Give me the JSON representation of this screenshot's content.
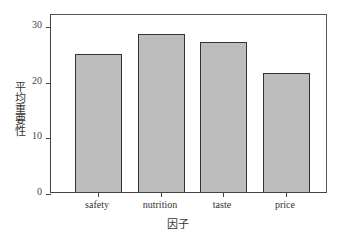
{
  "chart_data": {
    "type": "bar",
    "title": "",
    "xlabel": "因子",
    "ylabel": "平均重要性",
    "categories": [
      "safety",
      "nutrition",
      "taste",
      "price"
    ],
    "values": [
      24.8,
      28.4,
      26.9,
      21.4
    ],
    "ylim": [
      0,
      32
    ],
    "yticks": [
      0,
      10,
      20,
      30
    ],
    "grid": false,
    "legend": null,
    "bar_color": "#bdbdbd",
    "edge_color": "#333333"
  }
}
